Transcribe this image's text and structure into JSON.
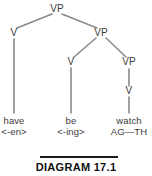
{
  "figure": {
    "caption": "DIAGRAM 17.1",
    "rule_color": "#1a1a1a",
    "line_color": "#8a8a8a",
    "text_color": "#3b3b3b",
    "background": "#ffffff"
  },
  "tree": {
    "type": "syntax-tree",
    "nodes": [
      {
        "id": "vp-root",
        "label": "VP",
        "x": 57,
        "y": 9
      },
      {
        "id": "v-have",
        "label": "V",
        "x": 14,
        "y": 33
      },
      {
        "id": "vp-2",
        "label": "VP",
        "x": 101,
        "y": 33
      },
      {
        "id": "v-be",
        "label": "V",
        "x": 71,
        "y": 62
      },
      {
        "id": "vp-3",
        "label": "VP",
        "x": 129,
        "y": 62
      },
      {
        "id": "v-watch",
        "label": "V",
        "x": 129,
        "y": 91
      }
    ],
    "edges": [
      {
        "from": "vp-root",
        "to": "v-have"
      },
      {
        "from": "vp-root",
        "to": "vp-2"
      },
      {
        "from": "vp-2",
        "to": "v-be"
      },
      {
        "from": "vp-2",
        "to": "vp-3"
      },
      {
        "from": "vp-3",
        "to": "v-watch"
      },
      {
        "from": "v-have",
        "to": "leaf-have"
      },
      {
        "from": "v-be",
        "to": "leaf-be"
      },
      {
        "from": "v-watch",
        "to": "leaf-watch"
      }
    ],
    "leaves": [
      {
        "id": "leaf-have",
        "word": "have",
        "annotation": "<-en>",
        "x": 14,
        "y": 120
      },
      {
        "id": "leaf-be",
        "word": "be",
        "annotation": "<-ing>",
        "x": 71,
        "y": 120
      },
      {
        "id": "leaf-watch",
        "word": "watch",
        "annotation": "AG—TH",
        "x": 129,
        "y": 120
      }
    ]
  }
}
